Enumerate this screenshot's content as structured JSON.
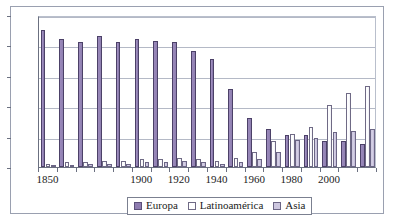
{
  "chart_data": {
    "type": "bar",
    "title": "",
    "xlabel": "",
    "ylabel": "",
    "ylim": [
      0,
      100
    ],
    "yticks": [
      0,
      20,
      40,
      60,
      80,
      100
    ],
    "grid": true,
    "legend_position": "bottom",
    "categories": [
      "1850",
      "1860",
      "1870",
      "1880",
      "1890",
      "1900",
      "1910",
      "1920",
      "1930",
      "1940",
      "1950",
      "1960",
      "1970",
      "1980",
      "1990",
      "2000",
      "2010",
      "2020"
    ],
    "xtick_labels": [
      "1850",
      "1900",
      "1920",
      "1940",
      "1960",
      "1980",
      "2000"
    ],
    "series": [
      {
        "name": "Europa",
        "color": "#8e7cb0",
        "values": [
          90,
          84,
          82,
          86,
          82,
          84,
          83,
          82,
          76,
          71,
          51,
          32,
          25,
          21,
          21,
          17,
          17,
          15
        ]
      },
      {
        "name": "Latinoamérica",
        "color": "#ffffff",
        "values": [
          2,
          3,
          3,
          4,
          4,
          5,
          5,
          6,
          5,
          4,
          6,
          10,
          17,
          22,
          26,
          41,
          49,
          53
        ]
      },
      {
        "name": "Asia",
        "color": "#cdc7df",
        "values": [
          1,
          1,
          2,
          2,
          2,
          3,
          3,
          4,
          3,
          2,
          3,
          5,
          10,
          18,
          19,
          23,
          24,
          25
        ]
      }
    ]
  },
  "legend": {
    "items": [
      {
        "label": "Europa",
        "key": "europa"
      },
      {
        "label": "Latinoamérica",
        "key": "latino"
      },
      {
        "label": "Asia",
        "key": "asia"
      }
    ]
  }
}
